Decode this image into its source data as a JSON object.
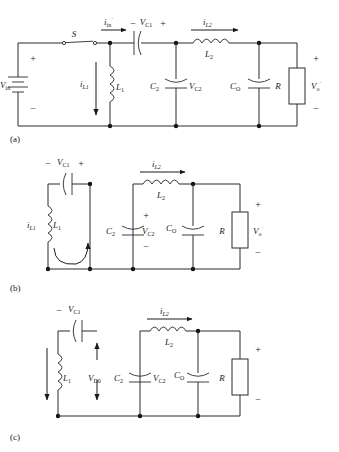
{
  "figure": {
    "background_color": "#ffffff",
    "line_color": "#2b2b2b",
    "panels": [
      {
        "id": "a",
        "caption": "(a)",
        "description": "Full converter with input source and switch",
        "labels": {
          "switch": "S",
          "input_source": "V",
          "input_source_sub": "in",
          "input_plus": "+",
          "input_minus": "−",
          "current_in": "i",
          "current_in_sub": "in",
          "current_in_sup": "˙",
          "cap1_minus": "−",
          "cap1_label": "V",
          "cap1_sub": "C1",
          "cap1_plus": "+",
          "ind1_current": "i",
          "ind1_current_sub": "L1",
          "ind1": "L",
          "ind1_sub": "1",
          "cap2": "C",
          "cap2_sub": "2",
          "cap2_volt": "V",
          "cap2_volt_sub": "C2",
          "ind2_current": "i",
          "ind2_current_sub": "L2",
          "ind2": "L",
          "ind2_sub": "2",
          "capo": "C",
          "capo_sub": "O",
          "res": "R",
          "out_volt": "V",
          "out_volt_sub": "o",
          "out_volt_sup": "˙",
          "out_plus": "+",
          "out_minus": "−"
        }
      },
      {
        "id": "b",
        "caption": "(b)",
        "description": "Switch-off mode with L1 freewheeling loop",
        "labels": {
          "cap1_minus": "−",
          "cap1_label": "V",
          "cap1_sub": "C1",
          "cap1_plus": "+",
          "ind1_current": "i",
          "ind1_current_sub": "L1",
          "ind1": "L",
          "ind1_sub": "1",
          "cap2": "C",
          "cap2_sub": "2",
          "cap2_volt": "V",
          "cap2_volt_sub": "C2",
          "cap2_plus": "+",
          "cap2_minus": "−",
          "ind2_current": "i",
          "ind2_current_sub": "L2",
          "ind2": "L",
          "ind2_sub": "2",
          "capo": "C",
          "capo_sub": "O",
          "res": "R",
          "out_volt": "V",
          "out_volt_sub": "o",
          "out_volt_sup": "˙",
          "out_plus": "+",
          "out_minus": "−"
        }
      },
      {
        "id": "c",
        "caption": "(c)",
        "description": "Discontinuous mode with diode blocking voltage",
        "labels": {
          "cap1_minus": "−",
          "cap1_label": "V",
          "cap1_sub": "C1",
          "ind1": "L",
          "ind1_sub": "1",
          "diode_volt": "V",
          "diode_volt_sub": "D0",
          "cap2": "C",
          "cap2_sub": "2",
          "cap2_volt": "V",
          "cap2_volt_sub": "C2",
          "ind2_current": "i",
          "ind2_current_sub": "L2",
          "ind2": "L",
          "ind2_sub": "2",
          "capo": "C",
          "capo_sub": "O",
          "res": "R",
          "out_plus": "+",
          "out_minus": "−"
        }
      }
    ]
  }
}
